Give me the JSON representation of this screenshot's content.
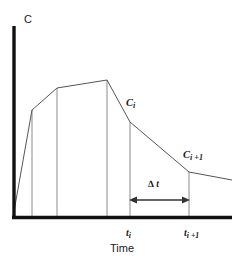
{
  "figure": {
    "title": "",
    "background_color": "#ffffff",
    "width": 240,
    "height": 268
  },
  "axes": {
    "y_label": "C",
    "x_label": "Time",
    "axis_color": "#111111",
    "axis_width": 3,
    "origin": {
      "x": 13,
      "y": 217
    },
    "x_end": 232,
    "y_top": 26
  },
  "labels": {
    "c_i": "C",
    "c_i_sub": "i",
    "c_i_plus_1": "C",
    "c_i_plus_1_sub": "i +1",
    "t_i": "t",
    "t_i_sub": "i",
    "t_i_plus_1": "t",
    "t_i_plus_1_sub": "i +1",
    "delta_t": "∆ t"
  },
  "annotation": {
    "delta_arrow": {
      "label": "∆ t",
      "x_start": 130,
      "x_end": 189,
      "y": 200,
      "color": "#333333"
    }
  },
  "chart_data": {
    "type": "line",
    "title": "",
    "xlabel": "Time",
    "ylabel": "C",
    "grid": false,
    "legend": null,
    "axis_ticks": {
      "x": [
        "t_i",
        "t_i+1"
      ],
      "y": []
    },
    "series": [
      {
        "name": "concentration-curve",
        "color": "#555555",
        "line_width": 1,
        "points": [
          {
            "x": 13,
            "y": 217
          },
          {
            "x": 32,
            "y": 110
          },
          {
            "x": 57,
            "y": 88
          },
          {
            "x": 107,
            "y": 80
          },
          {
            "x": 130,
            "y": 122
          },
          {
            "x": 189,
            "y": 172
          },
          {
            "x": 232,
            "y": 180
          }
        ]
      }
    ],
    "drop_lines": [
      {
        "name": "drop-line-1",
        "x": 32,
        "y_top": 110,
        "y_bottom": 217
      },
      {
        "name": "drop-line-2",
        "x": 57,
        "y_top": 88,
        "y_bottom": 217
      },
      {
        "name": "drop-line-3",
        "x": 107,
        "y_top": 80,
        "y_bottom": 217
      },
      {
        "name": "drop-line-ti",
        "x": 130,
        "y_top": 122,
        "y_bottom": 217
      },
      {
        "name": "drop-line-ti-plus-1",
        "x": 189,
        "y_top": 172,
        "y_bottom": 217
      }
    ],
    "drop_line_color": "#8a8a8a"
  }
}
